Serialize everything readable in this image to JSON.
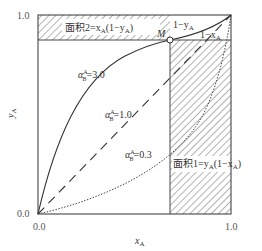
{
  "diagram": {
    "type": "vapor-liquid equilibrium y-x diagram",
    "axes": {
      "xlabel": "x",
      "xlabel_sub": "A",
      "ylabel": "y",
      "ylabel_sub": "A",
      "x_ticks": [
        "0.0",
        "1.0"
      ],
      "y_ticks": [
        "0.0",
        "1.0"
      ]
    },
    "curves": [
      {
        "id": "alpha3",
        "label_prefix": "α",
        "label_sup": "A",
        "label_sub": "B",
        "label_value": "=3.0",
        "style": "solid"
      },
      {
        "id": "alpha1",
        "label_prefix": "α",
        "label_sup": "A",
        "label_sub": "B",
        "label_value": "=1.0",
        "style": "dashed"
      },
      {
        "id": "alpha03",
        "label_prefix": "α",
        "label_sup": "A",
        "label_sub": "B",
        "label_value": "=0.3",
        "style": "dotted"
      }
    ],
    "point": {
      "label": "M"
    },
    "areas": {
      "area2": {
        "text_prefix": "面积2=x",
        "sub1": "A",
        "mid": "(1−y",
        "sub2": "A",
        "end": ")"
      },
      "area1": {
        "text_prefix": "面积1=y",
        "sub1": "A",
        "mid": "(1−x",
        "sub2": "A",
        "end": ")"
      }
    },
    "segment_labels": {
      "one_minus_y": {
        "text": "1−y",
        "sub": "A"
      },
      "one_minus_x": {
        "text": "1−x",
        "sub": "A"
      }
    },
    "colors": {
      "line": "#333333",
      "hatch": "#555555",
      "background": "#ffffff"
    }
  }
}
